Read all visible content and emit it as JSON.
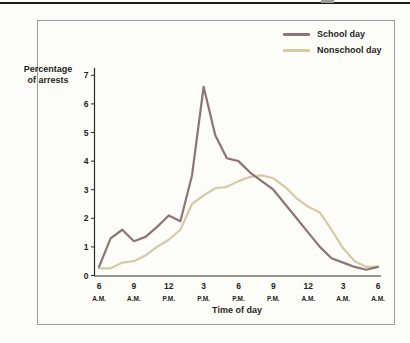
{
  "page": {
    "top_rule_color": "#1c1c1c",
    "tab_mark_color": "#9b9b9b"
  },
  "chart": {
    "ylabel_line1": "Percentage",
    "ylabel_line2": "of arrests",
    "xlabel": "Time of day"
  },
  "chart_data": {
    "type": "line",
    "title": "",
    "xlabel": "Time of day",
    "ylabel": "Percentage of arrests",
    "ylim": [
      0,
      7
    ],
    "y_ticks": [
      0,
      1,
      2,
      3,
      4,
      5,
      6,
      7
    ],
    "grid": "off",
    "legend_position": "top-right",
    "x_ticks": [
      {
        "hour": "6",
        "period": "A.M."
      },
      {
        "hour": "9",
        "period": "A.M."
      },
      {
        "hour": "12",
        "period": "P.M."
      },
      {
        "hour": "3",
        "period": "P.M."
      },
      {
        "hour": "6",
        "period": "P.M."
      },
      {
        "hour": "9",
        "period": "P.M."
      },
      {
        "hour": "12",
        "period": "A.M."
      },
      {
        "hour": "3",
        "period": "A.M."
      },
      {
        "hour": "6",
        "period": "A.M."
      }
    ],
    "x_description": "hourly points from 6 A.M. through 6 A.M. next day",
    "series": [
      {
        "name": "School day",
        "color": "#8d7671",
        "values": [
          0.3,
          1.3,
          1.6,
          1.2,
          1.35,
          1.7,
          2.1,
          1.9,
          3.5,
          6.6,
          4.9,
          4.1,
          4.0,
          3.6,
          3.3,
          3.0,
          2.5,
          2.0,
          1.5,
          1.0,
          0.6,
          0.45,
          0.3,
          0.2,
          0.3
        ]
      },
      {
        "name": "Nonschool day",
        "color": "#d7c9a6",
        "values": [
          0.25,
          0.25,
          0.45,
          0.5,
          0.7,
          1.0,
          1.25,
          1.6,
          2.5,
          2.8,
          3.05,
          3.1,
          3.3,
          3.45,
          3.5,
          3.4,
          3.1,
          2.7,
          2.4,
          2.2,
          1.6,
          0.95,
          0.5,
          0.3,
          0.3
        ]
      }
    ]
  }
}
